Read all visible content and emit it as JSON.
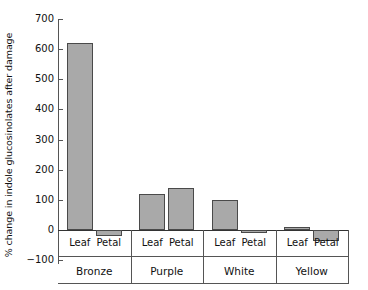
{
  "chart_data": {
    "type": "bar",
    "title": "",
    "subtitle": "",
    "xlabel": "",
    "ylabel": "% change in indole glucosinolates after damage",
    "ylim": [
      -100,
      700
    ],
    "yticks": [
      700,
      600,
      500,
      400,
      300,
      200,
      100,
      0,
      -100
    ],
    "ytick_labels": [
      "700",
      "600",
      "500",
      "400",
      "300",
      "200",
      "100",
      "0",
      "−100"
    ],
    "grid": false,
    "legend": false,
    "legend_position": "none",
    "categories": [
      "Bronze",
      "Purple",
      "White",
      "Yellow"
    ],
    "subcategories": [
      "Leaf",
      "Petal"
    ],
    "series": [
      {
        "name": "Leaf",
        "values": [
          620,
          120,
          100,
          10
        ]
      },
      {
        "name": "Petal",
        "values": [
          -20,
          138,
          -8,
          -35
        ]
      }
    ],
    "bars": [
      {
        "group": "Bronze",
        "part": "Leaf",
        "value": 620
      },
      {
        "group": "Bronze",
        "part": "Petal",
        "value": -20
      },
      {
        "group": "Purple",
        "part": "Leaf",
        "value": 120
      },
      {
        "group": "Purple",
        "part": "Petal",
        "value": 138
      },
      {
        "group": "White",
        "part": "Leaf",
        "value": 100
      },
      {
        "group": "White",
        "part": "Petal",
        "value": -8
      },
      {
        "group": "Yellow",
        "part": "Leaf",
        "value": 10
      },
      {
        "group": "Yellow",
        "part": "Petal",
        "value": -35
      }
    ],
    "colors": {
      "bar_fill": "#a9a9a9",
      "bar_border": "#4a4a4a",
      "axis": "#555555",
      "baseline": "#333333",
      "text": "#111111",
      "background": "#ffffff"
    }
  }
}
